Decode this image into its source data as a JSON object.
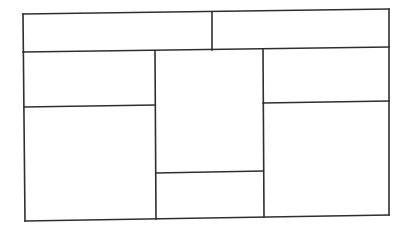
{
  "diagram": {
    "type": "layout-wireframe",
    "stroke_color": "#2e2e2e",
    "background": "#ffffff",
    "outer_frame": {
      "tl": [
        23,
        14
      ],
      "tr": [
        389,
        9
      ],
      "br": [
        389,
        215
      ],
      "bl": [
        25,
        221
      ]
    },
    "regions": [
      {
        "id": "header-left",
        "row": "header",
        "col": 1
      },
      {
        "id": "header-right",
        "row": "header",
        "col": 2
      },
      {
        "id": "left-top",
        "col": "left",
        "position": "top"
      },
      {
        "id": "left-bottom",
        "col": "left",
        "position": "bottom"
      },
      {
        "id": "middle-top",
        "col": "middle",
        "position": "top"
      },
      {
        "id": "middle-bottom",
        "col": "middle",
        "position": "bottom"
      },
      {
        "id": "right-top",
        "col": "right",
        "position": "top"
      },
      {
        "id": "right-bottom",
        "col": "right",
        "position": "bottom"
      }
    ],
    "lines": [
      {
        "name": "outer-top",
        "x1": 23,
        "y1": 14,
        "x2": 389,
        "y2": 9
      },
      {
        "name": "outer-right",
        "x1": 389,
        "y1": 9,
        "x2": 389,
        "y2": 215
      },
      {
        "name": "outer-bottom",
        "x1": 25,
        "y1": 221,
        "x2": 389,
        "y2": 215
      },
      {
        "name": "outer-left",
        "x1": 23,
        "y1": 14,
        "x2": 25,
        "y2": 221
      },
      {
        "name": "header-bottom",
        "x1": 23,
        "y1": 52,
        "x2": 389,
        "y2": 47
      },
      {
        "name": "header-divider",
        "x1": 212,
        "y1": 12,
        "x2": 212,
        "y2": 50
      },
      {
        "name": "left-middle-divider",
        "x1": 155,
        "y1": 51,
        "x2": 156,
        "y2": 219
      },
      {
        "name": "middle-right-divider",
        "x1": 263,
        "y1": 49,
        "x2": 264,
        "y2": 217
      },
      {
        "name": "left-column-split",
        "x1": 24,
        "y1": 107,
        "x2": 155,
        "y2": 105
      },
      {
        "name": "middle-column-split",
        "x1": 156,
        "y1": 173,
        "x2": 263,
        "y2": 171
      },
      {
        "name": "right-column-split",
        "x1": 263,
        "y1": 103,
        "x2": 389,
        "y2": 101
      }
    ]
  }
}
